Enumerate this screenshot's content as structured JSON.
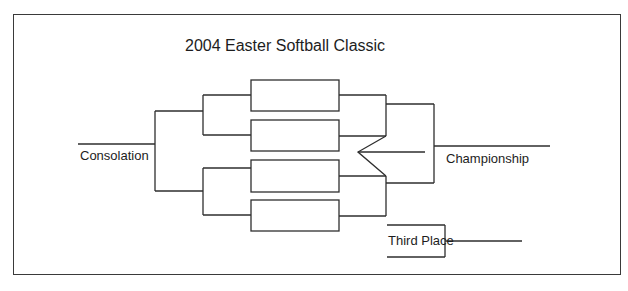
{
  "title": "2004 Easter Softball Classic",
  "labels": {
    "consolation": "Consolation",
    "championship": "Championship",
    "third_place": "Third Place"
  },
  "bracket": {
    "slots": [
      {
        "id": "game-1",
        "text": ""
      },
      {
        "id": "game-2",
        "text": ""
      },
      {
        "id": "game-3",
        "text": ""
      },
      {
        "id": "game-4",
        "text": ""
      }
    ]
  },
  "colors": {
    "line": "#2e2e2e",
    "text": "#1d1d1d",
    "background": "#ffffff"
  }
}
